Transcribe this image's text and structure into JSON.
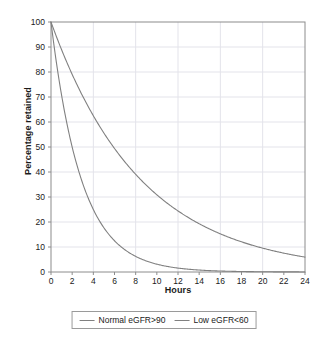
{
  "chart_data": {
    "type": "line",
    "title": "",
    "xlabel": "Hours",
    "ylabel": "Percentage retained",
    "xlim": [
      0,
      24
    ],
    "ylim": [
      0,
      100
    ],
    "grid": true,
    "legend_position": "bottom",
    "x_ticks": [
      0,
      2,
      4,
      6,
      8,
      10,
      12,
      14,
      16,
      18,
      20,
      22,
      24
    ],
    "y_ticks": [
      0,
      10,
      20,
      30,
      40,
      50,
      60,
      70,
      80,
      90,
      100
    ],
    "x": [
      0,
      1,
      2,
      3,
      4,
      5,
      6,
      7,
      8,
      9,
      10,
      11,
      12,
      13,
      14,
      15,
      16,
      17,
      18,
      19,
      20,
      21,
      22,
      23,
      24
    ],
    "series": [
      {
        "name": "Normal eGFR>90",
        "color": "#808080",
        "half_life_hours": 2,
        "values": [
          100,
          70.7,
          50,
          35.4,
          25,
          17.7,
          12.5,
          8.8,
          6.3,
          4.4,
          3.1,
          2.2,
          1.6,
          1.1,
          0.8,
          0.6,
          0.4,
          0.3,
          0.2,
          0.1,
          0.1,
          0.1,
          0,
          0,
          0
        ]
      },
      {
        "name": "Low eGFR<60",
        "color": "#808080",
        "half_life_hours": 5.9,
        "values": [
          100,
          89.1,
          79.4,
          70.7,
          63.0,
          56.1,
          50.0,
          44.6,
          39.7,
          35.4,
          31.5,
          28.1,
          25.0,
          22.3,
          19.9,
          17.7,
          15.8,
          14.1,
          12.5,
          11.2,
          10.0,
          8.9,
          7.9,
          7.1,
          6.3
        ]
      }
    ],
    "legend": [
      {
        "label": "Normal eGFR>90",
        "color": "#808080"
      },
      {
        "label": "Low eGFR<60",
        "color": "#808080"
      }
    ]
  },
  "style": {
    "background": "#ffffff",
    "axis_color": "#8c8c8c",
    "grid_color": "#e3e3ea",
    "line_color": "#808080",
    "text_color": "#1a1a1a"
  }
}
